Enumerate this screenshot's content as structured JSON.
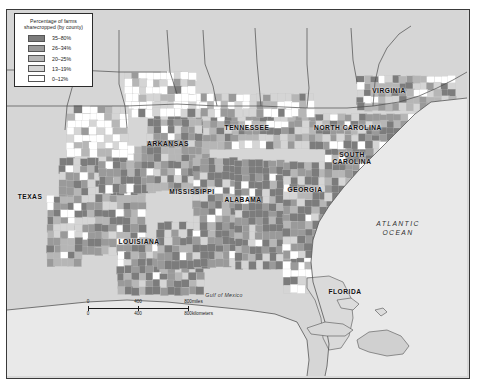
{
  "map": {
    "title": "Percentage of farms sharecropped (by county)",
    "background_color": "#d9d9d9",
    "ocean_color": "#e8e8e8",
    "legend": {
      "title_line1": "Percentage of farms",
      "title_line2": "sharecropped (by county)",
      "entries": [
        {
          "label": "35–80%",
          "color": "#7c7c7c"
        },
        {
          "label": "26–34%",
          "color": "#9a9a9a"
        },
        {
          "label": "20–25%",
          "color": "#b6b6b6"
        },
        {
          "label": "13–19%",
          "color": "#d5d5d5"
        },
        {
          "label": "0–12%",
          "color": "#ffffff"
        }
      ]
    },
    "state_labels": [
      {
        "name": "TEXAS",
        "x": 30,
        "y": 196,
        "lines": [
          "TEXAS"
        ]
      },
      {
        "name": "ARKANSAS",
        "x": 168,
        "y": 143,
        "lines": [
          "ARKANSAS"
        ]
      },
      {
        "name": "LOUISIANA",
        "x": 139,
        "y": 241,
        "lines": [
          "LOUISIANA"
        ]
      },
      {
        "name": "MISSISSIPPI",
        "x": 192,
        "y": 191,
        "lines": [
          "MISSISSIPPI"
        ]
      },
      {
        "name": "ALABAMA",
        "x": 243,
        "y": 199,
        "lines": [
          "ALABAMA"
        ]
      },
      {
        "name": "TENNESSEE",
        "x": 247,
        "y": 127,
        "lines": [
          "TENNESSEE"
        ]
      },
      {
        "name": "GEORGIA",
        "x": 305,
        "y": 189,
        "lines": [
          "GEORGIA"
        ]
      },
      {
        "name": "SOUTH CAROLINA",
        "x": 352,
        "y": 158,
        "lines": [
          "SOUTH",
          "CAROLINA"
        ]
      },
      {
        "name": "NORTH CAROLINA",
        "x": 348,
        "y": 127,
        "lines": [
          "NORTH CAROLINA"
        ]
      },
      {
        "name": "VIRGINIA",
        "x": 389,
        "y": 90,
        "lines": [
          "VIRGINIA"
        ]
      },
      {
        "name": "FLORIDA",
        "x": 345,
        "y": 291,
        "lines": [
          "FLORIDA"
        ]
      }
    ],
    "water_labels": [
      {
        "name": "ATLANTIC OCEAN",
        "x": 398,
        "y": 229,
        "lines": [
          "ATLANTIC",
          "OCEAN"
        ]
      },
      {
        "name": "Gulf of Mexico",
        "x": 224,
        "y": 295,
        "lines": [
          "Gulf of Mexico"
        ]
      }
    ],
    "scale_bar": {
      "miles_ticks": [
        "0",
        "400",
        "800"
      ],
      "miles_unit": "miles",
      "km_ticks": [
        "0",
        "400",
        "800"
      ],
      "km_unit": "kilometers"
    }
  },
  "chart_data": {
    "type": "heatmap",
    "title": "Percentage of farms sharecropped (by county)",
    "xlabel": "",
    "ylabel": "",
    "legend_position": "top-left",
    "grid": false,
    "categories": [
      "35–80%",
      "26–34%",
      "20–25%",
      "13–19%",
      "0–12%"
    ],
    "values": [
      5,
      4,
      3,
      2,
      1
    ],
    "colors": [
      "#7c7c7c",
      "#9a9a9a",
      "#b6b6b6",
      "#d5d5d5",
      "#ffffff"
    ],
    "regions": [
      {
        "name": "TEXAS",
        "dominant_class": "13–19%",
        "notes": "east Texas counties 26–80%"
      },
      {
        "name": "ARKANSAS",
        "dominant_class": "35–80%"
      },
      {
        "name": "LOUISIANA",
        "dominant_class": "26–34%"
      },
      {
        "name": "MISSISSIPPI",
        "dominant_class": "35–80%"
      },
      {
        "name": "ALABAMA",
        "dominant_class": "35–80%"
      },
      {
        "name": "TENNESSEE",
        "dominant_class": "20–25%"
      },
      {
        "name": "GEORGIA",
        "dominant_class": "35–80%"
      },
      {
        "name": "SOUTH CAROLINA",
        "dominant_class": "35–80%"
      },
      {
        "name": "NORTH CAROLINA",
        "dominant_class": "26–34%"
      },
      {
        "name": "VIRGINIA",
        "dominant_class": "13–19%"
      },
      {
        "name": "FLORIDA",
        "dominant_class": "0–12%"
      }
    ]
  }
}
